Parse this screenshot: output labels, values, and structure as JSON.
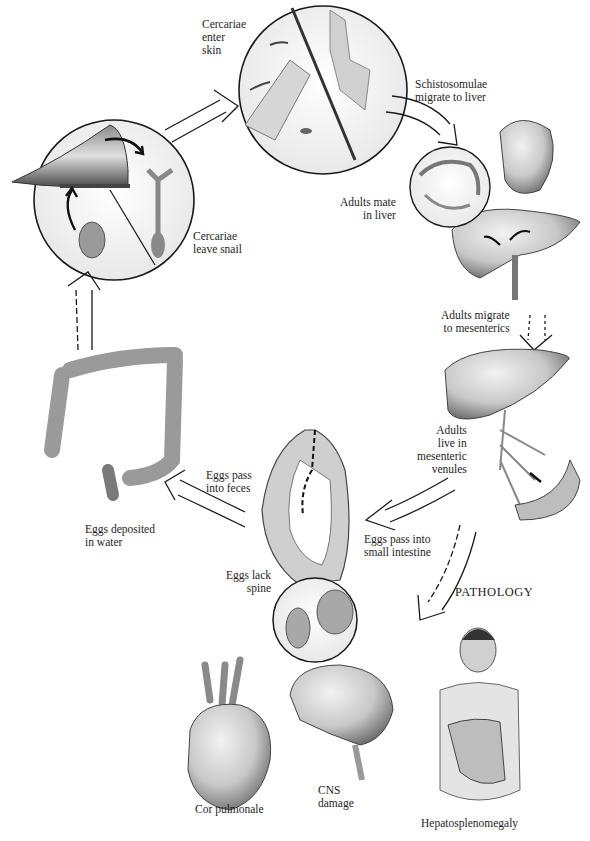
{
  "diagram": {
    "stages": [
      {
        "id": "cercariae-enter-skin",
        "label": "Cercariae\nenter\nskin"
      },
      {
        "id": "schistosomulae-migrate",
        "label": "Schistosomulae\nmigrate to liver"
      },
      {
        "id": "adults-mate-liver",
        "label": "Adults mate\nin liver"
      },
      {
        "id": "adults-migrate-mesenterics",
        "label": "Adults migrate\nto mesenterics"
      },
      {
        "id": "adults-live-venules",
        "label": "Adults\nlive in\nmesenteric\nvenules"
      },
      {
        "id": "eggs-small-intestine",
        "label": "Eggs pass into\nsmall intestine"
      },
      {
        "id": "eggs-lack-spine",
        "label": "Eggs lack\nspine"
      },
      {
        "id": "eggs-into-feces",
        "label": "Eggs pass\ninto feces"
      },
      {
        "id": "eggs-deposited-water",
        "label": "Eggs deposited\nin water"
      },
      {
        "id": "cercariae-leave-snail",
        "label": "Cercariae\nleave snail"
      }
    ],
    "pathology": {
      "heading": "PATHOLOGY",
      "items": [
        {
          "id": "cor-pulmonale",
          "label": "Cor pulmonale"
        },
        {
          "id": "cns-damage",
          "label": "CNS\ndamage"
        },
        {
          "id": "hepatosplenomegaly",
          "label": "Hepatosplenomegaly"
        }
      ]
    },
    "colors": {
      "outline": "#1a1a1a",
      "tissue_fill": "#d9d9d9",
      "tissue_shade": "#9a9a9a",
      "background": "#ffffff"
    }
  }
}
